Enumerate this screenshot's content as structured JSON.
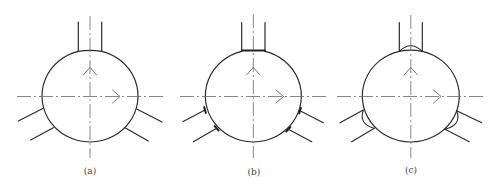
{
  "figure": {
    "panels": [
      {
        "id": "a",
        "caption": "(a)",
        "caption_pos": [
          90,
          171
        ],
        "vessel": {
          "cx": 90,
          "cy": 96,
          "rx": 48,
          "ry": 46
        },
        "centerline_h": {
          "x1": 17,
          "x2": 163,
          "y": 96.5
        },
        "centerline_v": {
          "x": 90,
          "y1": 16,
          "y2": 158
        },
        "top_pipe": {
          "x_left": 78.3,
          "x_right": 101.7,
          "y_top": 22,
          "y_join": 51.4
        },
        "joint_type": "plain",
        "branches": [
          {
            "x1": 43.3,
            "y1": 108.3,
            "x2": 18.3,
            "y2": 121
          },
          {
            "x1": 53.3,
            "y1": 127.7,
            "x2": 30.7,
            "y2": 140
          },
          {
            "x1": 136.7,
            "y1": 109,
            "x2": 162,
            "y2": 122
          },
          {
            "x1": 125,
            "y1": 127.7,
            "x2": 148.3,
            "y2": 141
          }
        ],
        "arrow_up": {
          "x": 90,
          "y": 67.3
        },
        "arrow_right": {
          "x": 120,
          "y": 96.5
        }
      },
      {
        "id": "b",
        "caption": "(b)",
        "caption_pos": [
          254,
          172
        ],
        "vessel": {
          "cx": 253.3,
          "cy": 96,
          "rx": 48,
          "ry": 46
        },
        "centerline_h": {
          "x1": 180,
          "x2": 327,
          "y": 96.5
        },
        "centerline_v": {
          "x": 253.3,
          "y1": 14,
          "y2": 158
        },
        "top_pipe": {
          "x_left": 241.7,
          "x_right": 265,
          "y_top": 22.7,
          "y_join": 50.5
        },
        "joint_type": "flat",
        "branches": [
          {
            "x1": 205,
            "y1": 110,
            "x2": 182.7,
            "y2": 121.7
          },
          {
            "x1": 216.7,
            "y1": 128.3,
            "x2": 193.3,
            "y2": 141.7
          },
          {
            "x1": 300,
            "y1": 110.7,
            "x2": 323.3,
            "y2": 122.7
          },
          {
            "x1": 288.3,
            "y1": 129.3,
            "x2": 311.7,
            "y2": 141.7
          }
        ],
        "arrow_up": {
          "x": 253.3,
          "y": 67.3
        },
        "arrow_right": {
          "x": 283.5,
          "y": 96.5
        }
      },
      {
        "id": "c",
        "caption": "(c)",
        "caption_pos": [
          411,
          170
        ],
        "vessel": {
          "cx": 410.8,
          "cy": 96,
          "rx": 48.5,
          "ry": 46
        },
        "centerline_h": {
          "x1": 337,
          "x2": 484,
          "y": 96.5
        },
        "centerline_v": {
          "x": 410.8,
          "y1": 15,
          "y2": 158
        },
        "top_pipe": {
          "x_left": 399.3,
          "x_right": 422.3,
          "y_top": 22.7,
          "y_join": 51.5
        },
        "joint_type": "bead",
        "branches": [
          {
            "x1": 363.3,
            "y1": 110,
            "x2": 340,
            "y2": 122.7
          },
          {
            "x1": 374.3,
            "y1": 128.3,
            "x2": 351.7,
            "y2": 141.7
          },
          {
            "x1": 456.7,
            "y1": 110.7,
            "x2": 481.7,
            "y2": 122.7
          },
          {
            "x1": 445,
            "y1": 129.3,
            "x2": 469.3,
            "y2": 141.7
          }
        ],
        "beads": [
          {
            "x1": 363.3,
            "y1": 110,
            "cx": 358.5,
            "cy": 124.5,
            "x2": 374.3,
            "y2": 128.3
          },
          {
            "x1": 456.7,
            "y1": 110.7,
            "cx": 462,
            "cy": 125,
            "x2": 445,
            "y2": 129.3
          }
        ],
        "arrow_up": {
          "x": 410.8,
          "y": 67.3
        },
        "arrow_right": {
          "x": 441,
          "y": 96.5
        }
      }
    ],
    "colors": {
      "outline": "#2b2b2b",
      "centerline": "#6a6a6a",
      "background": "#ffffff"
    }
  }
}
